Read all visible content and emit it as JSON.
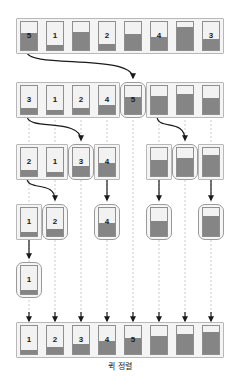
{
  "caption": "퀵 정렬",
  "diagram": {
    "title": "퀵 정렬",
    "type": "quicksort-partition-trace",
    "colors": {
      "fill": "#858585",
      "cell_bg": "#f2f2f2",
      "cell_border": "#8f8f8f",
      "group_bg": "#f4f4f4",
      "group_border": "#b8b8b8",
      "arrow": "#1a1a1a",
      "guide": "#cccccc"
    },
    "rows": [
      {
        "name": "initial-array",
        "y": 18,
        "groups": [
          {
            "name": "group-initial",
            "x": 16,
            "width": 208,
            "pivot": false,
            "cells": [
              {
                "label": "5",
                "fill": 62,
                "pivot": true
              },
              {
                "label": "1",
                "fill": 18,
                "pivot": false
              },
              {
                "label": "",
                "fill": 66,
                "pivot": false
              },
              {
                "label": "2",
                "fill": 22,
                "pivot": false
              },
              {
                "label": "",
                "fill": 56,
                "pivot": false
              },
              {
                "label": "4",
                "fill": 48,
                "pivot": false
              },
              {
                "label": "",
                "fill": 82,
                "pivot": false
              },
              {
                "label": "3",
                "fill": 40,
                "pivot": false
              }
            ]
          }
        ]
      },
      {
        "name": "partition-level-1",
        "y": 82,
        "groups": [
          {
            "name": "group-left-1",
            "x": 16,
            "width": 104,
            "pivot": false,
            "cells": [
              {
                "label": "3",
                "fill": 22,
                "pivot": false
              },
              {
                "label": "1",
                "fill": 16,
                "pivot": false
              },
              {
                "label": "2",
                "fill": 20,
                "pivot": false
              },
              {
                "label": "4",
                "fill": 32,
                "pivot": false
              }
            ]
          },
          {
            "name": "group-pivot-1",
            "x": 120,
            "width": 26,
            "pivot": true,
            "cells": [
              {
                "label": "5",
                "fill": 62,
                "pivot": true
              }
            ]
          },
          {
            "name": "group-right-1",
            "x": 146,
            "width": 78,
            "pivot": false,
            "cells": [
              {
                "label": "",
                "fill": 66,
                "pivot": false
              },
              {
                "label": "",
                "fill": 72,
                "pivot": false
              },
              {
                "label": "",
                "fill": 56,
                "pivot": false
              }
            ]
          }
        ]
      },
      {
        "name": "partition-level-2",
        "y": 144,
        "groups": [
          {
            "name": "group-left-2a",
            "x": 16,
            "width": 52,
            "pivot": false,
            "cells": [
              {
                "label": "2",
                "fill": 20,
                "pivot": false
              },
              {
                "label": "1",
                "fill": 16,
                "pivot": false
              }
            ]
          },
          {
            "name": "group-pivot-2a",
            "x": 68,
            "width": 26,
            "pivot": true,
            "cells": [
              {
                "label": "3",
                "fill": 36,
                "pivot": true
              }
            ]
          },
          {
            "name": "group-right-2a",
            "x": 94,
            "width": 26,
            "pivot": false,
            "cells": [
              {
                "label": "4",
                "fill": 48,
                "pivot": false
              }
            ]
          },
          {
            "name": "group-left-2b",
            "x": 146,
            "width": 26,
            "pivot": false,
            "cells": [
              {
                "label": "",
                "fill": 56,
                "pivot": false
              }
            ]
          },
          {
            "name": "group-pivot-2b",
            "x": 172,
            "width": 26,
            "pivot": true,
            "cells": [
              {
                "label": "",
                "fill": 66,
                "pivot": true
              }
            ]
          },
          {
            "name": "group-right-2b",
            "x": 198,
            "width": 26,
            "pivot": false,
            "cells": [
              {
                "label": "",
                "fill": 76,
                "pivot": false
              }
            ]
          }
        ]
      },
      {
        "name": "partition-level-3",
        "y": 204,
        "groups": [
          {
            "name": "group-left-3a",
            "x": 16,
            "width": 26,
            "pivot": false,
            "cells": [
              {
                "label": "1",
                "fill": 16,
                "pivot": false
              }
            ]
          },
          {
            "name": "group-pivot-3a",
            "x": 42,
            "width": 26,
            "pivot": true,
            "cells": [
              {
                "label": "2",
                "fill": 24,
                "pivot": true
              }
            ]
          },
          {
            "name": "group-pivot-3b",
            "x": 94,
            "width": 26,
            "pivot": true,
            "cells": [
              {
                "label": "4",
                "fill": 48,
                "pivot": true
              }
            ]
          },
          {
            "name": "group-pivot-3c",
            "x": 146,
            "width": 26,
            "pivot": true,
            "cells": [
              {
                "label": "",
                "fill": 52,
                "pivot": true
              }
            ]
          },
          {
            "name": "group-pivot-3d",
            "x": 198,
            "width": 26,
            "pivot": true,
            "cells": [
              {
                "label": "",
                "fill": 72,
                "pivot": true
              }
            ]
          }
        ]
      },
      {
        "name": "partition-level-4",
        "y": 262,
        "groups": [
          {
            "name": "group-pivot-4a",
            "x": 16,
            "width": 26,
            "pivot": true,
            "cells": [
              {
                "label": "1",
                "fill": 14,
                "pivot": true
              }
            ]
          }
        ]
      },
      {
        "name": "sorted-array",
        "y": 322,
        "groups": [
          {
            "name": "group-sorted",
            "x": 16,
            "width": 208,
            "pivot": false,
            "cells": [
              {
                "label": "1",
                "fill": 14,
                "pivot": false
              },
              {
                "label": "2",
                "fill": 24,
                "pivot": false
              },
              {
                "label": "3",
                "fill": 34,
                "pivot": false
              },
              {
                "label": "4",
                "fill": 46,
                "pivot": false
              },
              {
                "label": "5",
                "fill": 56,
                "pivot": false
              },
              {
                "label": "",
                "fill": 64,
                "pivot": false
              },
              {
                "label": "",
                "fill": 72,
                "pivot": false
              },
              {
                "label": "",
                "fill": 80,
                "pivot": false
              }
            ]
          }
        ]
      }
    ],
    "arrows": [
      {
        "name": "arrow-pivot-1",
        "from_x": 27,
        "from_y": 52,
        "to_x": 133,
        "to_y": 78
      },
      {
        "name": "arrow-pivot-2a",
        "from_x": 27,
        "from_y": 116,
        "to_x": 81,
        "to_y": 140
      },
      {
        "name": "arrow-pivot-2b",
        "from_x": 157,
        "from_y": 116,
        "to_x": 185,
        "to_y": 140
      },
      {
        "name": "arrow-pivot-3a",
        "from_x": 27,
        "from_y": 178,
        "to_x": 55,
        "to_y": 200
      },
      {
        "name": "arrow-pivot-3b",
        "from_x": 107,
        "from_y": 178,
        "to_x": 107,
        "to_y": 200
      },
      {
        "name": "arrow-pivot-3c",
        "from_x": 159,
        "from_y": 178,
        "to_x": 159,
        "to_y": 200
      },
      {
        "name": "arrow-pivot-3d",
        "from_x": 211,
        "from_y": 178,
        "to_x": 211,
        "to_y": 200
      },
      {
        "name": "arrow-pivot-4a",
        "from_x": 29,
        "from_y": 238,
        "to_x": 29,
        "to_y": 258
      }
    ],
    "guides": [
      {
        "name": "guide-col-1",
        "x": 29
      },
      {
        "name": "guide-col-2",
        "x": 55
      },
      {
        "name": "guide-col-3",
        "x": 81
      },
      {
        "name": "guide-col-4",
        "x": 107
      },
      {
        "name": "guide-col-5",
        "x": 133
      },
      {
        "name": "guide-col-6",
        "x": 159
      },
      {
        "name": "guide-col-7",
        "x": 185
      },
      {
        "name": "guide-col-8",
        "x": 211
      }
    ],
    "final_arrows": [
      {
        "name": "final-arrow-1",
        "x": 29
      },
      {
        "name": "final-arrow-2",
        "x": 55
      },
      {
        "name": "final-arrow-3",
        "x": 81
      },
      {
        "name": "final-arrow-4",
        "x": 107
      },
      {
        "name": "final-arrow-5",
        "x": 133
      },
      {
        "name": "final-arrow-6",
        "x": 159
      },
      {
        "name": "final-arrow-7",
        "x": 185
      },
      {
        "name": "final-arrow-8",
        "x": 211
      }
    ]
  }
}
